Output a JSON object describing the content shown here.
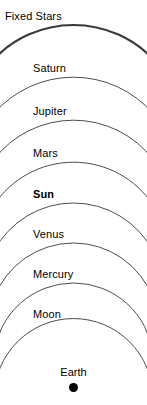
{
  "diagram": {
    "width": 147,
    "height": 405,
    "background_color": "#ffffff",
    "arc_color": "#4d4d4d",
    "arc_color_outer": "#3a3a3a",
    "text_color": "#000000"
  },
  "spheres": [
    {
      "label": "Fixed Stars",
      "label_x": 5,
      "label_y": 10,
      "bold": false,
      "apex_y": 25,
      "stroke_width": 2.2,
      "color": "#3a3a3a",
      "radius": 110
    },
    {
      "label": "Saturn",
      "label_x": 33,
      "label_y": 62,
      "bold": false,
      "apex_y": 77,
      "stroke_width": 1,
      "color": "#4d4d4d",
      "radius": 105
    },
    {
      "label": "Jupiter",
      "label_x": 33,
      "label_y": 105,
      "bold": false,
      "apex_y": 120,
      "stroke_width": 1,
      "color": "#4d4d4d",
      "radius": 100
    },
    {
      "label": "Mars",
      "label_x": 33,
      "label_y": 147,
      "bold": false,
      "apex_y": 162,
      "stroke_width": 1,
      "color": "#4d4d4d",
      "radius": 95
    },
    {
      "label": "Sun",
      "label_x": 33,
      "label_y": 188,
      "bold": true,
      "apex_y": 203,
      "stroke_width": 1,
      "color": "#4d4d4d",
      "radius": 90
    },
    {
      "label": "Venus",
      "label_x": 33,
      "label_y": 228,
      "bold": false,
      "apex_y": 243,
      "stroke_width": 1,
      "color": "#4d4d4d",
      "radius": 85
    },
    {
      "label": "Mercury",
      "label_x": 33,
      "label_y": 268,
      "bold": false,
      "apex_y": 283,
      "stroke_width": 1,
      "color": "#4d4d4d",
      "radius": 80
    },
    {
      "label": "Moon",
      "label_x": 33,
      "label_y": 308,
      "bold": false,
      "apex_y": 323,
      "stroke_width": 1,
      "color": "#4d4d4d",
      "radius": 75
    }
  ],
  "earth": {
    "label": "Earth",
    "label_y": 366,
    "dot_color": "#000000",
    "dot_diameter": 9
  }
}
